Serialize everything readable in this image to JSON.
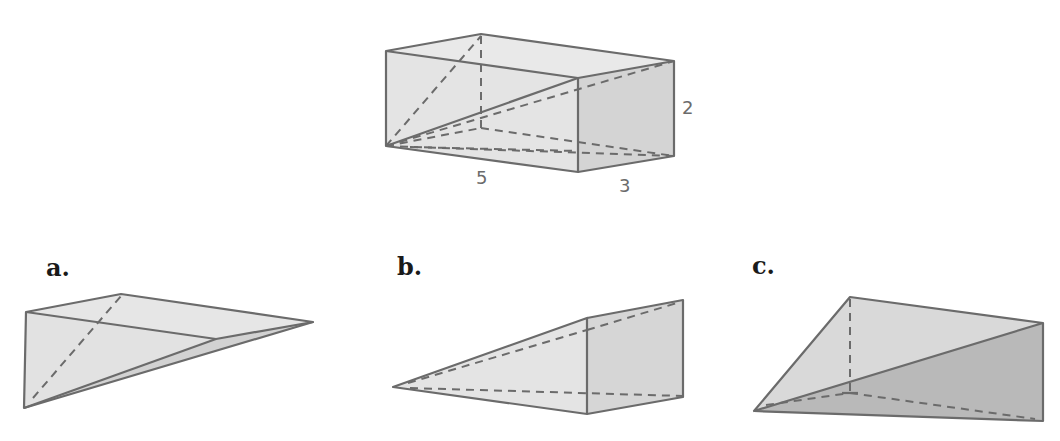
{
  "colors": {
    "edge": "#6b6b6b",
    "face_light": "#e6e6e6",
    "face_mid": "#d9d9d9",
    "face_dark": "#bdbdbd",
    "label": "#1a1a1a"
  },
  "prism": {
    "dimensions": {
      "length": "5",
      "width": "3",
      "height": "2"
    }
  },
  "options": [
    {
      "label": "a."
    },
    {
      "label": "b."
    },
    {
      "label": "c."
    }
  ]
}
